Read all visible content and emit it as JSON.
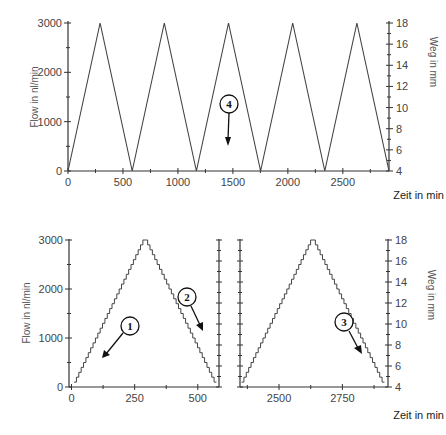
{
  "chart_data": [
    {
      "type": "line",
      "panel": "top",
      "title": "",
      "xlabel": "Zeit in min",
      "ylabel": "Flow in nl/min",
      "y2label": "Weg in mm",
      "xlim": [
        0,
        2920
      ],
      "ylim": [
        0,
        3000
      ],
      "y2lim": [
        4,
        18
      ],
      "xticks": [
        "0",
        "500",
        "1000",
        "1500",
        "2000",
        "2500"
      ],
      "yticks": [
        "0",
        "1000",
        "2000",
        "3000"
      ],
      "y2ticks": [
        "4",
        "6",
        "8",
        "10",
        "12",
        "14",
        "16",
        "18"
      ],
      "series": [
        {
          "name": "Flow",
          "x": [
            0,
            292,
            584,
            876,
            1168,
            1460,
            1752,
            2044,
            2336,
            2628,
            2920
          ],
          "values": [
            0,
            3000,
            0,
            3000,
            0,
            3000,
            0,
            3000,
            0,
            3000,
            0
          ]
        }
      ],
      "annotations": [
        {
          "label": "4",
          "direction": "down"
        }
      ],
      "grid": false
    },
    {
      "type": "line",
      "panel": "bottom-left",
      "xlabel": "",
      "ylabel": "Flow in nl/min",
      "xlim": [
        0,
        584
      ],
      "ylim": [
        0,
        3000
      ],
      "xticks": [
        "0",
        "250",
        "500"
      ],
      "yticks": [
        "0",
        "1000",
        "2000",
        "3000"
      ],
      "series": [
        {
          "name": "Flow (stepped)",
          "x": [
            0,
            292,
            584
          ],
          "values": [
            0,
            3000,
            0
          ]
        }
      ],
      "annotations": [
        {
          "label": "1",
          "direction": "down-left"
        },
        {
          "label": "2",
          "direction": "down-right"
        }
      ],
      "grid": false
    },
    {
      "type": "line",
      "panel": "bottom-right",
      "xlabel": "Zeit in min",
      "y2label": "Weg in mm",
      "xlim": [
        2336,
        2920
      ],
      "y2lim": [
        4,
        18
      ],
      "xticks": [
        "2500",
        "2750"
      ],
      "y2ticks": [
        "4",
        "6",
        "8",
        "10",
        "12",
        "14",
        "16",
        "18"
      ],
      "series": [
        {
          "name": "Weg (stepped)",
          "x": [
            2336,
            2628,
            2920
          ],
          "values": [
            4,
            18,
            4
          ]
        }
      ],
      "annotations": [
        {
          "label": "3",
          "direction": "down-right"
        }
      ],
      "grid": false
    }
  ],
  "labels": {
    "flow": "Flow in nl/min",
    "weg": "Weg in mm",
    "zeit": "Zeit in min",
    "ann1": "1",
    "ann2": "2",
    "ann3": "3",
    "ann4": "4"
  },
  "ticks": {
    "top_x": [
      "0",
      "500",
      "1000",
      "1500",
      "2000",
      "2500"
    ],
    "flow_y": [
      "0",
      "1000",
      "2000",
      "3000"
    ],
    "weg_y": [
      "4",
      "6",
      "8",
      "10",
      "12",
      "14",
      "16",
      "18"
    ],
    "bl_x": [
      "0",
      "250",
      "500"
    ],
    "br_x": [
      "2500",
      "2750"
    ]
  }
}
